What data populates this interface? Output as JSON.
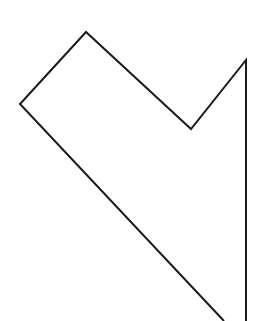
{
  "canvas": {
    "width": 256,
    "height": 321,
    "background": "#ffffff"
  },
  "shape": {
    "kind": "polyline-outline",
    "stroke_color": "#1a1a1a",
    "stroke_width": 2,
    "fill": "none",
    "points": [
      [
        224,
        321
      ],
      [
        20,
        104
      ],
      [
        86,
        32
      ],
      [
        191,
        129
      ],
      [
        246,
        60
      ],
      [
        246,
        321
      ]
    ],
    "vertices": {
      "left": [
        20,
        104
      ],
      "top": [
        86,
        32
      ],
      "notch": [
        191,
        129
      ],
      "top_right": [
        246,
        60
      ],
      "bottom_diagonal_exit": [
        224,
        321
      ],
      "bottom_vertical_exit": [
        246,
        321
      ]
    }
  }
}
